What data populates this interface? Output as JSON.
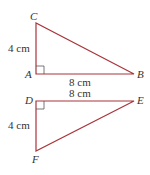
{
  "colors": {
    "line": "#a8343a",
    "text": "#333333",
    "right_angle": "#555555"
  },
  "triangle1": {
    "vertices": {
      "C": "C",
      "A": "A",
      "B": "B"
    },
    "side_vertical": "4 cm",
    "side_horizontal": "8 cm",
    "right_angle_at": "A"
  },
  "triangle2": {
    "vertices": {
      "D": "D",
      "E": "E",
      "F": "F"
    },
    "side_vertical": "4 cm",
    "side_horizontal": "8 cm",
    "right_angle_at": "D"
  }
}
